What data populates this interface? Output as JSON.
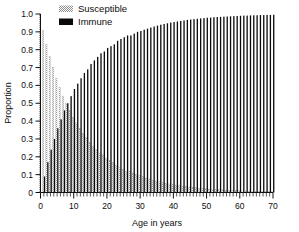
{
  "figure": {
    "name": "susceptible-immune-by-age-bar-chart",
    "background": "#ffffff"
  },
  "legend": {
    "position": "top-center",
    "items": [
      {
        "label": "Susceptible",
        "swatch": "stipple-light",
        "color": "#b4b4b4"
      },
      {
        "label": "Immune",
        "swatch": "solid-dark",
        "color": "#0a0a0a"
      }
    ]
  },
  "axes": {
    "x": {
      "label": "Age in years",
      "ticklabels": [
        "0",
        "10",
        "20",
        "30",
        "40",
        "50",
        "60",
        "70"
      ],
      "min": 0,
      "max": 70,
      "major_step": 10,
      "minor_step": 1
    },
    "y": {
      "label": "Proportion",
      "ticklabels": [
        "0",
        "0.1",
        "0.2",
        "0.3",
        "0.4",
        "0.5",
        "0.6",
        "0.7",
        "0.8",
        "0.9",
        "1.0"
      ],
      "min": 0,
      "max": 1,
      "major_step": 0.1
    }
  },
  "chart_data": {
    "type": "bar",
    "title": "",
    "xlabel": "Age in years",
    "ylabel": "Proportion",
    "xlim": [
      0,
      70
    ],
    "ylim": [
      0,
      1.0
    ],
    "grid": false,
    "legend_position": "top-center",
    "bar_mode": "grouped",
    "categories": [
      0,
      1,
      2,
      3,
      4,
      5,
      6,
      7,
      8,
      9,
      10,
      11,
      12,
      13,
      14,
      15,
      16,
      17,
      18,
      19,
      20,
      21,
      22,
      23,
      24,
      25,
      26,
      27,
      28,
      29,
      30,
      31,
      32,
      33,
      34,
      35,
      36,
      37,
      38,
      39,
      40,
      41,
      42,
      43,
      44,
      45,
      46,
      47,
      48,
      49,
      50,
      51,
      52,
      53,
      54,
      55,
      56,
      57,
      58,
      59,
      60,
      61,
      62,
      63,
      64,
      65,
      66,
      67,
      68,
      69,
      70
    ],
    "series": [
      {
        "name": "Susceptible",
        "color": "#b4b4b4",
        "pattern": "stipple",
        "values": [
          1.0,
          0.91,
          0.83,
          0.76,
          0.7,
          0.64,
          0.59,
          0.54,
          0.5,
          0.46,
          0.42,
          0.39,
          0.36,
          0.33,
          0.31,
          0.28,
          0.26,
          0.24,
          0.22,
          0.21,
          0.19,
          0.18,
          0.17,
          0.15,
          0.14,
          0.13,
          0.12,
          0.12,
          0.11,
          0.1,
          0.095,
          0.088,
          0.082,
          0.076,
          0.07,
          0.065,
          0.06,
          0.056,
          0.052,
          0.048,
          0.045,
          0.042,
          0.039,
          0.036,
          0.033,
          0.031,
          0.029,
          0.027,
          0.025,
          0.023,
          0.021,
          0.02,
          0.018,
          0.017,
          0.016,
          0.015,
          0.014,
          0.013,
          0.012,
          0.011,
          0.01,
          0.009,
          0.009,
          0.008,
          0.007,
          0.007,
          0.006,
          0.006,
          0.005,
          0.005,
          0.004
        ]
      },
      {
        "name": "Immune",
        "color": "#0a0a0a",
        "pattern": "solid",
        "values": [
          0.0,
          0.09,
          0.17,
          0.24,
          0.3,
          0.36,
          0.41,
          0.46,
          0.5,
          0.54,
          0.58,
          0.61,
          0.64,
          0.67,
          0.69,
          0.72,
          0.74,
          0.76,
          0.78,
          0.79,
          0.81,
          0.82,
          0.83,
          0.85,
          0.86,
          0.87,
          0.88,
          0.88,
          0.89,
          0.9,
          0.905,
          0.912,
          0.918,
          0.924,
          0.93,
          0.935,
          0.94,
          0.944,
          0.948,
          0.952,
          0.955,
          0.958,
          0.961,
          0.964,
          0.967,
          0.969,
          0.971,
          0.973,
          0.975,
          0.977,
          0.979,
          0.98,
          0.982,
          0.983,
          0.984,
          0.985,
          0.986,
          0.987,
          0.988,
          0.989,
          0.99,
          0.991,
          0.991,
          0.992,
          0.993,
          0.993,
          0.994,
          0.994,
          0.995,
          0.995,
          0.996
        ]
      }
    ]
  }
}
